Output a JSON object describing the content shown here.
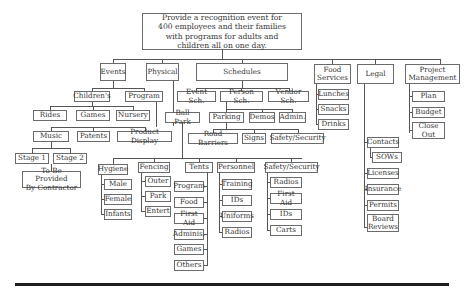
{
  "title": "Provide a recognition event for 400 employees and their families with programs for adults and children all on one day.",
  "nodes": [
    {
      "id": "root",
      "label": "Provide a recognition event for\n400 employees and their families\nwith programs for adults and\nchildren all on one day.",
      "x": 142,
      "y": 13,
      "w": 160,
      "h": 37,
      "root": true
    },
    {
      "id": "events",
      "label": "Events",
      "x": 100,
      "y": 63,
      "w": 26,
      "h": 18
    },
    {
      "id": "physical",
      "label": "Physical",
      "x": 146,
      "y": 63,
      "w": 33,
      "h": 18
    },
    {
      "id": "schedules",
      "label": "Schedules",
      "x": 196,
      "y": 63,
      "w": 92,
      "h": 18
    },
    {
      "id": "food_services",
      "label": "Food\nServices",
      "x": 314,
      "y": 64,
      "w": 37,
      "h": 20
    },
    {
      "id": "legal",
      "label": "Legal",
      "x": 357,
      "y": 64,
      "w": 37,
      "h": 20
    },
    {
      "id": "project_mgmt",
      "label": "Project\nManagement",
      "x": 405,
      "y": 64,
      "w": 55,
      "h": 20
    },
    {
      "id": "childrens",
      "label": "Children's",
      "x": 74,
      "y": 91,
      "w": 36,
      "h": 11
    },
    {
      "id": "program",
      "label": "Program",
      "x": 125,
      "y": 91,
      "w": 38,
      "h": 11
    },
    {
      "id": "rides",
      "label": "Rides",
      "x": 33,
      "y": 110,
      "w": 34,
      "h": 11
    },
    {
      "id": "games",
      "label": "Games",
      "x": 76,
      "y": 110,
      "w": 34,
      "h": 11
    },
    {
      "id": "nursery",
      "label": "Nursery",
      "x": 116,
      "y": 110,
      "w": 34,
      "h": 11
    },
    {
      "id": "music",
      "label": "Music",
      "x": 33,
      "y": 131,
      "w": 36,
      "h": 11
    },
    {
      "id": "patents",
      "label": "Patents",
      "x": 77,
      "y": 131,
      "w": 33,
      "h": 11
    },
    {
      "id": "product_display",
      "label": "Product Display",
      "x": 117,
      "y": 131,
      "w": 55,
      "h": 11
    },
    {
      "id": "stage1",
      "label": "Stage 1",
      "x": 15,
      "y": 153,
      "w": 34,
      "h": 11
    },
    {
      "id": "stage2",
      "label": "Stage 2",
      "x": 53,
      "y": 153,
      "w": 34,
      "h": 11
    },
    {
      "id": "contractor",
      "label": "To Be Provided\nBy Contractor",
      "x": 22,
      "y": 171,
      "w": 59,
      "h": 17
    },
    {
      "id": "event_sch",
      "label": "Event Sch.",
      "x": 177,
      "y": 91,
      "w": 39,
      "h": 11
    },
    {
      "id": "person_sch",
      "label": "Person Sch.",
      "x": 220,
      "y": 91,
      "w": 43,
      "h": 11
    },
    {
      "id": "vendor_sch",
      "label": "Vendor Sch.",
      "x": 268,
      "y": 91,
      "w": 41,
      "h": 11
    },
    {
      "id": "ball_park",
      "label": "Ball Park",
      "x": 165,
      "y": 112,
      "w": 35,
      "h": 11
    },
    {
      "id": "parking",
      "label": "Parking",
      "x": 209,
      "y": 112,
      "w": 35,
      "h": 11
    },
    {
      "id": "demos",
      "label": "Demos",
      "x": 249,
      "y": 112,
      "w": 26,
      "h": 11
    },
    {
      "id": "admin",
      "label": "Admin.",
      "x": 279,
      "y": 112,
      "w": 27,
      "h": 11
    },
    {
      "id": "road_barriers",
      "label": "Road Barriers",
      "x": 188,
      "y": 133,
      "w": 50,
      "h": 11
    },
    {
      "id": "signs",
      "label": "Signs",
      "x": 242,
      "y": 133,
      "w": 24,
      "h": 11
    },
    {
      "id": "safety1",
      "label": "Safety/Security",
      "x": 271,
      "y": 133,
      "w": 53,
      "h": 11
    },
    {
      "id": "hygiene",
      "label": "Hygiene",
      "x": 98,
      "y": 164,
      "w": 30,
      "h": 11
    },
    {
      "id": "male",
      "label": "Male",
      "x": 104,
      "y": 179,
      "w": 28,
      "h": 11
    },
    {
      "id": "female",
      "label": "Female",
      "x": 104,
      "y": 194,
      "w": 28,
      "h": 11
    },
    {
      "id": "infants",
      "label": "Infants",
      "x": 104,
      "y": 209,
      "w": 28,
      "h": 11
    },
    {
      "id": "fencing",
      "label": "Fencing",
      "x": 138,
      "y": 162,
      "w": 32,
      "h": 11
    },
    {
      "id": "outer",
      "label": "Outer",
      "x": 145,
      "y": 176,
      "w": 26,
      "h": 11
    },
    {
      "id": "park",
      "label": "Park",
      "x": 145,
      "y": 191,
      "w": 26,
      "h": 11
    },
    {
      "id": "entert",
      "label": "Entert",
      "x": 145,
      "y": 206,
      "w": 26,
      "h": 11
    },
    {
      "id": "tents",
      "label": "Tents",
      "x": 185,
      "y": 162,
      "w": 28,
      "h": 11
    },
    {
      "id": "t_program",
      "label": "Program",
      "x": 174,
      "y": 181,
      "w": 30,
      "h": 11
    },
    {
      "id": "t_food",
      "label": "Food",
      "x": 174,
      "y": 197,
      "w": 30,
      "h": 11
    },
    {
      "id": "t_firstaid",
      "label": "First Aid",
      "x": 174,
      "y": 213,
      "w": 30,
      "h": 11
    },
    {
      "id": "t_adminis",
      "label": "Adminis.",
      "x": 174,
      "y": 229,
      "w": 30,
      "h": 11
    },
    {
      "id": "t_games",
      "label": "Games",
      "x": 174,
      "y": 244,
      "w": 30,
      "h": 11
    },
    {
      "id": "t_others",
      "label": "Others",
      "x": 174,
      "y": 260,
      "w": 30,
      "h": 11
    },
    {
      "id": "personnel",
      "label": "Personnel",
      "x": 217,
      "y": 162,
      "w": 38,
      "h": 11
    },
    {
      "id": "p_training",
      "label": "Training",
      "x": 222,
      "y": 179,
      "w": 30,
      "h": 11
    },
    {
      "id": "p_ids",
      "label": "IDs",
      "x": 222,
      "y": 195,
      "w": 30,
      "h": 11
    },
    {
      "id": "p_uniforms",
      "label": "Uniforms",
      "x": 222,
      "y": 211,
      "w": 30,
      "h": 11
    },
    {
      "id": "p_radios",
      "label": "Radios",
      "x": 222,
      "y": 227,
      "w": 30,
      "h": 11
    },
    {
      "id": "safety2",
      "label": "Safety/Security",
      "x": 265,
      "y": 162,
      "w": 53,
      "h": 11
    },
    {
      "id": "s_radios",
      "label": "Radios",
      "x": 270,
      "y": 177,
      "w": 32,
      "h": 11
    },
    {
      "id": "s_firstaid",
      "label": "First Aid",
      "x": 270,
      "y": 193,
      "w": 32,
      "h": 11
    },
    {
      "id": "s_ids",
      "label": "IDs",
      "x": 270,
      "y": 209,
      "w": 32,
      "h": 11
    },
    {
      "id": "s_carts",
      "label": "Carts",
      "x": 270,
      "y": 225,
      "w": 32,
      "h": 11
    },
    {
      "id": "lunches",
      "label": "Lunches",
      "x": 318,
      "y": 89,
      "w": 31,
      "h": 11
    },
    {
      "id": "snacks",
      "label": "Snacks",
      "x": 318,
      "y": 104,
      "w": 31,
      "h": 11
    },
    {
      "id": "drinks",
      "label": "Drinks",
      "x": 318,
      "y": 119,
      "w": 31,
      "h": 11
    },
    {
      "id": "contacts",
      "label": "Contacts",
      "x": 367,
      "y": 137,
      "w": 32,
      "h": 11
    },
    {
      "id": "sows",
      "label": "SOWs",
      "x": 372,
      "y": 152,
      "w": 30,
      "h": 11
    },
    {
      "id": "licenses",
      "label": "Licenses",
      "x": 367,
      "y": 168,
      "w": 32,
      "h": 11
    },
    {
      "id": "insurance",
      "label": "Insurance",
      "x": 367,
      "y": 184,
      "w": 32,
      "h": 11
    },
    {
      "id": "permits",
      "label": "Permits",
      "x": 367,
      "y": 200,
      "w": 32,
      "h": 11
    },
    {
      "id": "board_reviews",
      "label": "Board\nReviews",
      "x": 367,
      "y": 214,
      "w": 32,
      "h": 18
    },
    {
      "id": "plan",
      "label": "Plan",
      "x": 412,
      "y": 91,
      "w": 33,
      "h": 11
    },
    {
      "id": "budget",
      "label": "Budget",
      "x": 412,
      "y": 107,
      "w": 33,
      "h": 11
    },
    {
      "id": "close_out",
      "label": "Close\nOut",
      "x": 412,
      "y": 122,
      "w": 33,
      "h": 17
    }
  ],
  "lines": [
    [
      "v",
      222,
      50,
      9
    ],
    [
      "h",
      113,
      59,
      328
    ],
    [
      "v",
      113,
      59,
      4
    ],
    [
      "v",
      162,
      59,
      4
    ],
    [
      "v",
      242,
      59,
      4
    ],
    [
      "v",
      332,
      59,
      5
    ],
    [
      "v",
      375,
      59,
      5
    ],
    [
      "v",
      440,
      59,
      5
    ],
    [
      "v",
      113,
      81,
      7
    ],
    [
      "h",
      92,
      88,
      52
    ],
    [
      "v",
      92,
      88,
      3
    ],
    [
      "v",
      144,
      88,
      3
    ],
    [
      "v",
      92,
      102,
      4
    ],
    [
      "h",
      50,
      106,
      83
    ],
    [
      "v",
      50,
      106,
      4
    ],
    [
      "v",
      93,
      106,
      4
    ],
    [
      "v",
      133,
      106,
      4
    ],
    [
      "v",
      156,
      102,
      25
    ],
    [
      "h",
      51,
      127,
      94
    ],
    [
      "v",
      51,
      127,
      4
    ],
    [
      "v",
      93,
      127,
      4
    ],
    [
      "v",
      145,
      127,
      4
    ],
    [
      "v",
      51,
      142,
      6
    ],
    [
      "h",
      32,
      148,
      38
    ],
    [
      "v",
      32,
      148,
      5
    ],
    [
      "v",
      70,
      148,
      5
    ],
    [
      "v",
      51,
      164,
      7
    ],
    [
      "v",
      173,
      81,
      45
    ],
    [
      "v",
      182,
      123,
      35
    ],
    [
      "h",
      113,
      158,
      189
    ],
    [
      "v",
      113,
      158,
      6
    ],
    [
      "v",
      154,
      158,
      4
    ],
    [
      "v",
      199,
      158,
      4
    ],
    [
      "v",
      236,
      158,
      4
    ],
    [
      "v",
      291,
      158,
      4
    ],
    [
      "v",
      101,
      175,
      40
    ],
    [
      "h",
      101,
      184,
      3
    ],
    [
      "h",
      101,
      199,
      3
    ],
    [
      "h",
      101,
      214,
      3
    ],
    [
      "v",
      141,
      173,
      39
    ],
    [
      "h",
      141,
      181,
      4
    ],
    [
      "h",
      141,
      196,
      4
    ],
    [
      "h",
      141,
      211,
      4
    ],
    [
      "v",
      207,
      173,
      93
    ],
    [
      "h",
      204,
      186,
      3
    ],
    [
      "h",
      204,
      202,
      3
    ],
    [
      "h",
      204,
      218,
      3
    ],
    [
      "h",
      204,
      234,
      3
    ],
    [
      "h",
      204,
      249,
      3
    ],
    [
      "h",
      204,
      265,
      3
    ],
    [
      "v",
      219,
      173,
      59
    ],
    [
      "h",
      219,
      184,
      3
    ],
    [
      "h",
      219,
      200,
      3
    ],
    [
      "h",
      219,
      216,
      3
    ],
    [
      "h",
      219,
      232,
      3
    ],
    [
      "v",
      267,
      173,
      57
    ],
    [
      "h",
      267,
      182,
      3
    ],
    [
      "h",
      267,
      198,
      3
    ],
    [
      "h",
      267,
      214,
      3
    ],
    [
      "h",
      267,
      230,
      3
    ],
    [
      "v",
      242,
      81,
      7
    ],
    [
      "h",
      196,
      88,
      93
    ],
    [
      "v",
      196,
      88,
      3
    ],
    [
      "v",
      241,
      88,
      3
    ],
    [
      "v",
      289,
      88,
      3
    ],
    [
      "v",
      226,
      102,
      7
    ],
    [
      "h",
      226,
      109,
      36
    ],
    [
      "v",
      226,
      109,
      3
    ],
    [
      "v",
      262,
      109,
      3
    ],
    [
      "v",
      292,
      109,
      3
    ],
    [
      "h",
      262,
      109,
      30
    ],
    [
      "v",
      226,
      123,
      6
    ],
    [
      "h",
      213,
      129,
      85
    ],
    [
      "v",
      213,
      129,
      4
    ],
    [
      "v",
      254,
      129,
      4
    ],
    [
      "v",
      298,
      129,
      4
    ],
    [
      "v",
      316,
      84,
      41
    ],
    [
      "h",
      316,
      94,
      2
    ],
    [
      "h",
      316,
      109,
      2
    ],
    [
      "h",
      316,
      124,
      2
    ],
    [
      "v",
      364,
      84,
      144
    ],
    [
      "h",
      364,
      142,
      3
    ],
    [
      "h",
      364,
      173,
      3
    ],
    [
      "h",
      364,
      189,
      3
    ],
    [
      "h",
      364,
      205,
      3
    ],
    [
      "h",
      364,
      227,
      3
    ],
    [
      "v",
      370,
      148,
      10
    ],
    [
      "h",
      370,
      157,
      2
    ],
    [
      "v",
      409,
      84,
      49
    ],
    [
      "h",
      409,
      96,
      3
    ],
    [
      "h",
      409,
      112,
      3
    ],
    [
      "h",
      409,
      130,
      3
    ]
  ],
  "colors": {
    "line": "#555555",
    "border": "#6b6b6b",
    "text": "#333333",
    "rule": "#1e1e1e"
  }
}
